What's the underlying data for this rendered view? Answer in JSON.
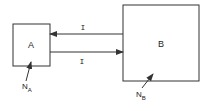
{
  "diagram": {
    "boxes": [
      {
        "id": "A",
        "label": "A"
      },
      {
        "id": "B",
        "label": "B"
      }
    ],
    "arrows": [
      {
        "from": "B",
        "to": "A",
        "label": "I"
      },
      {
        "from": "A",
        "to": "B",
        "label": "I"
      }
    ],
    "annotations": [
      {
        "target": "A",
        "main": "N",
        "sub": "A"
      },
      {
        "target": "B",
        "main": "N",
        "sub": "B"
      }
    ],
    "colors": {
      "stroke": "#333333",
      "background": "#ffffff"
    }
  }
}
